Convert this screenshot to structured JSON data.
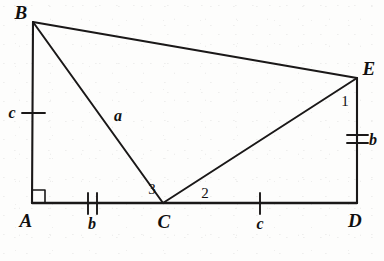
{
  "figure": {
    "type": "geometry-diagram",
    "stroke_color": "#1a1818",
    "background_color": "#fdfdfc",
    "points": [
      {
        "name": "A",
        "label": "A",
        "x": 32,
        "y": 203,
        "label_x": 26,
        "label_y": 220
      },
      {
        "name": "B",
        "label": "B",
        "x": 33,
        "y": 22,
        "label_x": 21,
        "label_y": 12
      },
      {
        "name": "C",
        "label": "C",
        "x": 163,
        "y": 203,
        "label_x": 164,
        "label_y": 221
      },
      {
        "name": "D",
        "label": "D",
        "x": 357,
        "y": 203,
        "label_x": 355,
        "label_y": 220
      },
      {
        "name": "E",
        "label": "E",
        "x": 357,
        "y": 78,
        "label_x": 369,
        "label_y": 68
      }
    ],
    "segments": [
      {
        "name": "segment-AB",
        "from": "A",
        "to": "B"
      },
      {
        "name": "segment-AD",
        "from": "A",
        "to": "D"
      },
      {
        "name": "segment-BE",
        "from": "B",
        "to": "E"
      },
      {
        "name": "segment-BC",
        "from": "B",
        "to": "C"
      },
      {
        "name": "segment-CE",
        "from": "C",
        "to": "E"
      },
      {
        "name": "segment-ED",
        "from": "E",
        "to": "D"
      }
    ],
    "side_labels": [
      {
        "name": "side-label-c-left",
        "text": "c",
        "x": 12,
        "y": 113,
        "segment": "segment-AB"
      },
      {
        "name": "side-label-a",
        "text": "a",
        "x": 118,
        "y": 116,
        "segment": "segment-BC"
      },
      {
        "name": "side-label-b-bottom",
        "text": "b",
        "x": 92,
        "y": 224,
        "segment": "segment-AC"
      },
      {
        "name": "side-label-c-bottom",
        "text": "c",
        "x": 260,
        "y": 224,
        "segment": "segment-CD"
      },
      {
        "name": "side-label-b-right",
        "text": "b",
        "x": 373,
        "y": 140,
        "segment": "segment-ED"
      }
    ],
    "angle_labels": [
      {
        "name": "angle-label-1",
        "text": "1",
        "x": 345,
        "y": 101,
        "at_point": "E"
      },
      {
        "name": "angle-label-2",
        "text": "2",
        "x": 205,
        "y": 193,
        "at_point": "C"
      },
      {
        "name": "angle-label-3",
        "text": "3",
        "x": 152,
        "y": 189,
        "at_point": "C"
      }
    ],
    "marks": [
      {
        "name": "right-angle-mark-A",
        "kind": "right-angle",
        "at_point": "A"
      },
      {
        "name": "tick-mark-AB",
        "kind": "single-tick",
        "segment": "segment-AB",
        "x": 33,
        "y": 113,
        "orientation": "vertical-segment"
      },
      {
        "name": "tick-mark-AC",
        "kind": "double-tick",
        "segment": "segment-AC",
        "x": 92,
        "y": 203,
        "orientation": "horizontal-segment"
      },
      {
        "name": "tick-mark-CD",
        "kind": "single-tick",
        "segment": "segment-CD",
        "x": 260,
        "y": 203,
        "orientation": "horizontal-segment"
      },
      {
        "name": "tick-mark-ED",
        "kind": "double-tick",
        "segment": "segment-ED",
        "x": 357,
        "y": 140,
        "orientation": "vertical-segment"
      }
    ]
  }
}
